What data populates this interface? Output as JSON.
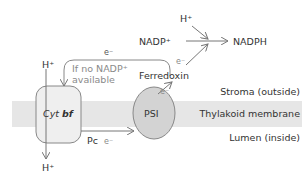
{
  "regions": {
    "stroma": "Stroma (outside)",
    "membrane": "Thylakoid membrane",
    "lumen": "Lumen (inside)"
  },
  "complexes": {
    "cyt_bf_prefix": "Cyt ",
    "cyt_bf_suffix": "bf",
    "psi": "PSI"
  },
  "carriers": {
    "plastocyanin": "Pc",
    "ferredoxin": "Ferredoxin"
  },
  "species": {
    "h_plus_top_left": "H⁺",
    "h_plus_bottom_left": "H⁺",
    "h_plus_top_right": "H⁺",
    "nadp_plus": "NADP⁺",
    "nadph": "NADPH"
  },
  "electrons": {
    "cyclic_top": "e⁻",
    "pc_to_psi": "e⁻",
    "psi_to_fd": "e⁻",
    "fd_to_nadp": "e⁻"
  },
  "annotations": {
    "cyclic_line1": "If no NADP⁺",
    "cyclic_line2": "available"
  },
  "colors": {
    "membrane": "#e6e6e6",
    "cyt_bf_fill": "#efefef",
    "psi_fill": "#d3d3d3",
    "outline": "#888888",
    "arrow": "#777777",
    "text": "#333333",
    "annotation": "#8a8a8a"
  }
}
